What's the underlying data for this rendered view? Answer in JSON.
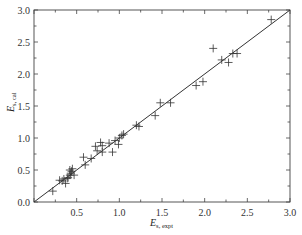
{
  "chart_data": {
    "type": "scatter",
    "title": "",
    "xlabel": "E",
    "xlabel_sub": "s, expt",
    "ylabel": "E",
    "ylabel_sub": "s, cal",
    "xlim": [
      0.0,
      3.0
    ],
    "ylim": [
      0.0,
      3.0
    ],
    "xticks": [
      "0.0",
      "0.5",
      "1.0",
      "1.5",
      "2.0",
      "2.5",
      "3.0"
    ],
    "yticks": [
      "0.0",
      "0.5",
      "1.0",
      "1.5",
      "2.0",
      "2.5",
      "3.0"
    ],
    "grid": false,
    "legend": null,
    "marker": "+",
    "reference_line": {
      "type": "y=x",
      "from": [
        0,
        0
      ],
      "to": [
        3,
        3
      ]
    },
    "series": [
      {
        "name": "data",
        "points": [
          [
            0.22,
            0.17
          ],
          [
            0.3,
            0.34
          ],
          [
            0.33,
            0.33
          ],
          [
            0.35,
            0.36
          ],
          [
            0.37,
            0.29
          ],
          [
            0.39,
            0.37
          ],
          [
            0.4,
            0.38
          ],
          [
            0.42,
            0.42
          ],
          [
            0.42,
            0.5
          ],
          [
            0.43,
            0.45
          ],
          [
            0.44,
            0.48
          ],
          [
            0.45,
            0.52
          ],
          [
            0.47,
            0.42
          ],
          [
            0.58,
            0.7
          ],
          [
            0.6,
            0.58
          ],
          [
            0.67,
            0.68
          ],
          [
            0.72,
            0.87
          ],
          [
            0.74,
            0.8
          ],
          [
            0.78,
            0.93
          ],
          [
            0.8,
            0.78
          ],
          [
            0.8,
            0.88
          ],
          [
            0.88,
            0.92
          ],
          [
            0.92,
            0.78
          ],
          [
            0.95,
            0.96
          ],
          [
            0.99,
            0.9
          ],
          [
            1.0,
            1.0
          ],
          [
            1.03,
            1.04
          ],
          [
            1.05,
            1.06
          ],
          [
            1.2,
            1.2
          ],
          [
            1.23,
            1.18
          ],
          [
            1.42,
            1.35
          ],
          [
            1.48,
            1.55
          ],
          [
            1.6,
            1.55
          ],
          [
            1.9,
            1.82
          ],
          [
            1.98,
            1.88
          ],
          [
            2.1,
            2.4
          ],
          [
            2.2,
            2.22
          ],
          [
            2.28,
            2.18
          ],
          [
            2.33,
            2.32
          ],
          [
            2.38,
            2.32
          ],
          [
            2.78,
            2.85
          ]
        ]
      }
    ]
  }
}
